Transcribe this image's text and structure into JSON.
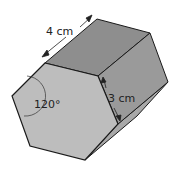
{
  "figure": {
    "type": "hexagonal-prism",
    "length_label": "4 cm",
    "edge_label": "3 cm",
    "angle_label": "120°"
  },
  "colors": {
    "front_face": "#bdbdbd",
    "top_face": "#8e8e8e",
    "side_face": "#9a9a9a",
    "bottom_face": "#a8a8a8",
    "edge": "#1a1a1a"
  }
}
